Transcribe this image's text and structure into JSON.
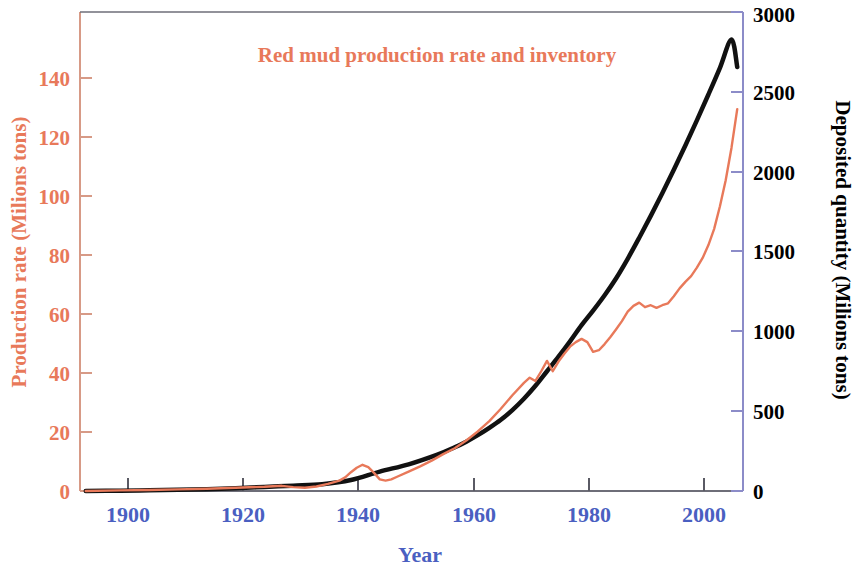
{
  "chart_data": {
    "type": "line",
    "title": "Red mud production rate and inventory",
    "xlabel": "Year",
    "ylabel": "Production rate (Milions tons)",
    "y2label": "Deposited quantity (Milions tons)",
    "xlim": [
      1893,
      2008
    ],
    "ylim": [
      0,
      148
    ],
    "y2lim": [
      0,
      2960
    ],
    "xticks": [
      "1900",
      "1920",
      "1940",
      "1960",
      "1980",
      "2000"
    ],
    "xtick_values": [
      1900,
      1920,
      1940,
      1960,
      1980,
      2000
    ],
    "yticks": [
      "0",
      "20",
      "40",
      "60",
      "80",
      "100",
      "120",
      "140"
    ],
    "ytick_values": [
      0,
      20,
      40,
      60,
      80,
      100,
      120,
      140
    ],
    "y2ticks": [
      "0",
      "500",
      "1000",
      "1500",
      "2000",
      "2500",
      "3000"
    ],
    "y2tick_values": [
      0,
      500,
      1000,
      1500,
      2000,
      2500,
      3000
    ],
    "grid": false,
    "legend": "none",
    "colors": {
      "production": "#E8795A",
      "inventory": "#111111",
      "xaxis_text": "#4A5FC1",
      "yaxis_text": "#E8795A",
      "y2axis_text": "#000000",
      "title": "#E8795A",
      "frame": "#8C8CC8"
    },
    "series": [
      {
        "name": "Production rate (annual)",
        "axis": "left",
        "color": "#E8795A",
        "units": "Milions tons",
        "x": [
          1894,
          1900,
          1905,
          1910,
          1915,
          1920,
          1925,
          1928,
          1930,
          1932,
          1934,
          1936,
          1938,
          1939,
          1940,
          1941,
          1942,
          1943,
          1944,
          1945,
          1946,
          1947,
          1948,
          1950,
          1952,
          1954,
          1956,
          1958,
          1960,
          1962,
          1964,
          1966,
          1968,
          1970,
          1971,
          1972,
          1973,
          1974,
          1975,
          1976,
          1977,
          1978,
          1979,
          1980,
          1981,
          1982,
          1983,
          1984,
          1985,
          1986,
          1987,
          1988,
          1989,
          1990,
          1991,
          1992,
          1993,
          1994,
          1995,
          1996,
          1997,
          1998,
          1999,
          2000,
          2001,
          2002,
          2003,
          2004,
          2005,
          2006,
          2007
        ],
        "y": [
          0.0,
          0.2,
          0.3,
          0.5,
          0.7,
          1.0,
          1.3,
          1.6,
          1.2,
          1.0,
          1.4,
          2.2,
          3.2,
          4.2,
          5.8,
          7.2,
          8.1,
          7.4,
          5.6,
          3.6,
          3.2,
          3.6,
          4.4,
          6.0,
          7.6,
          9.4,
          11.4,
          13.2,
          15.6,
          18.4,
          21.6,
          25.4,
          29.6,
          33.4,
          35.0,
          34.0,
          37.0,
          40.2,
          37.0,
          40.0,
          42.4,
          44.6,
          46.0,
          47.0,
          46.0,
          43.0,
          43.5,
          45.4,
          47.6,
          50.0,
          52.5,
          55.4,
          57.2,
          58.2,
          56.8,
          57.4,
          56.6,
          57.4,
          58.0,
          60.2,
          62.6,
          64.6,
          66.4,
          69.0,
          72.0,
          76.0,
          81.0,
          88.0,
          96.0,
          106.0,
          118.0
        ]
      },
      {
        "name": "Deposited quantity (cumulative inventory)",
        "axis": "right",
        "color": "#111111",
        "units": "Milions tons",
        "x": [
          1894,
          1900,
          1905,
          1910,
          1915,
          1920,
          1925,
          1930,
          1935,
          1940,
          1945,
          1950,
          1955,
          1958,
          1960,
          1962,
          1964,
          1966,
          1968,
          1970,
          1972,
          1974,
          1976,
          1978,
          1980,
          1982,
          1984,
          1986,
          1988,
          1990,
          1992,
          1994,
          1996,
          1998,
          2000,
          2002,
          2004,
          2006,
          2007
        ],
        "y": [
          0,
          2,
          4,
          7,
          11,
          17,
          25,
          33,
          42,
          68,
          120,
          165,
          225,
          270,
          305,
          345,
          390,
          440,
          500,
          570,
          650,
          740,
          830,
          925,
          1025,
          1115,
          1210,
          1315,
          1435,
          1565,
          1700,
          1840,
          1985,
          2135,
          2290,
          2450,
          2615,
          2790,
          2620
        ]
      }
    ],
    "annotations": [
      {
        "text": "WWII peak in production rate near 1942",
        "x": 1942,
        "y": 8.1
      },
      {
        "text": "post-war collapse near 1945",
        "x": 1945,
        "y": 3.6
      },
      {
        "text": "curves cross near 1982",
        "x": 1982,
        "y": 43
      },
      {
        "text": "plateau 1989-1995",
        "x": 1992,
        "y": 57
      },
      {
        "text": "black inventory curve ends at 2007",
        "x": 2007,
        "y": 2620
      },
      {
        "text": "red production curve ends at 2007",
        "x": 2007,
        "y": 118
      }
    ]
  },
  "figure": {
    "background": "#ffffff"
  }
}
